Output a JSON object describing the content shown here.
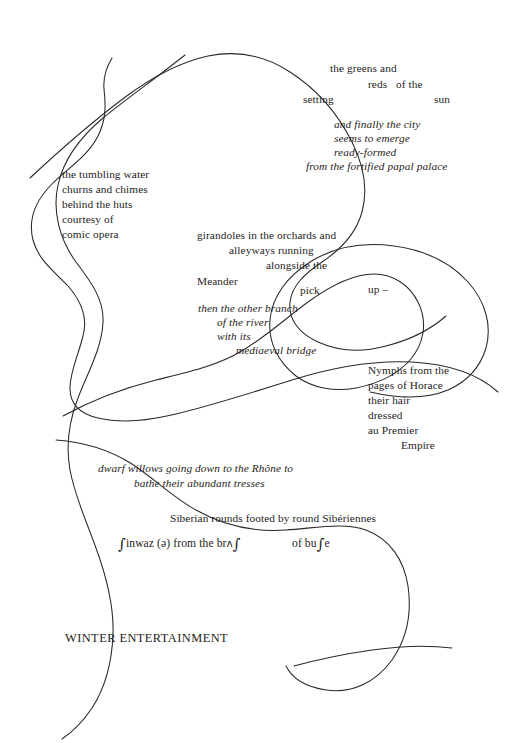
{
  "page": {
    "title": "WINTER ENTERTAINMENT",
    "width": 528,
    "height": 743,
    "background": "#ffffff",
    "ink_color": "#1f1d1d"
  },
  "stanzas": {
    "greens": {
      "line1": "the greens and",
      "line2": "reds   of the",
      "line3a": "setting",
      "line3b": "sun"
    },
    "city": {
      "line1": "and finally the city",
      "line2": "seems to emerge",
      "line3": "ready-formed",
      "line4": "from the fortified papal palace"
    },
    "tumbling": {
      "line1": "the tumbling water",
      "line2": "churns and chimes",
      "line3": "behind the huts",
      "line4": "courtesy of",
      "line5": "comic opera"
    },
    "girandoles": {
      "line1": "girandoles in the orchards and",
      "line2": "alleyways running",
      "line3": "alongside the",
      "line4": "Meander",
      "line5": "pick",
      "line6": "up –"
    },
    "branch": {
      "line1": "then the other branch",
      "line2": "of the river",
      "line3": "with its",
      "line4": "mediaeval bridge"
    },
    "nymphs": {
      "line1": "Nymphs from the",
      "line2": "pages of Horace",
      "line3": "their hair",
      "line4": "dressed",
      "line5": "au Premier",
      "line6": "Empire"
    },
    "willows": {
      "line1": "dwarf willows going down to the Rhône to",
      "line2": "bathe their abundant tresses"
    },
    "siberian": {
      "line1": "Siberian rounds footed by round Sibériennes"
    },
    "phonetic": {
      "seg1_symbol": "∫",
      "seg1_text": "inwaz (ə) from the br",
      "seg2_symbol_a": "ʌ",
      "seg2_symbol_b": "∫",
      "seg3_text": "of bu",
      "seg3_symbol": "∫",
      "seg3_tail": "e"
    },
    "footer": {
      "title": "WINTER ENTERTAINMENT"
    }
  },
  "curves": {
    "stroke_color": "#2a2726",
    "stroke_width": 1.05,
    "count": 5,
    "description": "five long freehand meandering ink curves crossing the page"
  }
}
